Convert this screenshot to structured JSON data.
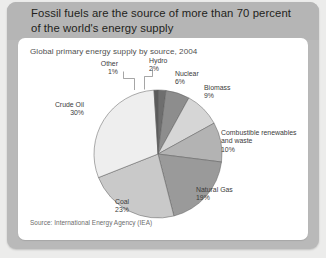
{
  "header": {
    "title": "Fossil fuels are the source of more than 70 percent of the world's energy supply"
  },
  "card": {
    "subtitle": "Global primary energy supply by source, 2004",
    "source": "Source: International Energy Agency (IEA)"
  },
  "chart_data": {
    "type": "pie",
    "title": "Global primary energy supply by source, 2004",
    "subtitle": "",
    "xlabel": "",
    "ylabel": "",
    "units": "percent",
    "total": 100,
    "source": "Source: International Energy Agency (IEA)",
    "legend_position": "none",
    "labels_outside": true,
    "start_angle_deg": 0,
    "direction": "clockwise",
    "categories": [
      "Hydro",
      "Nuclear",
      "Biomass",
      "Combustible renewables and waste",
      "Natural Gas",
      "Coal",
      "Crude Oil",
      "Other"
    ],
    "values": [
      2,
      6,
      9,
      10,
      19,
      23,
      30,
      1
    ],
    "slices": [
      {
        "label": "Hydro",
        "value": 2,
        "value_text": "2%",
        "color": "#6e6e6e"
      },
      {
        "label": "Nuclear",
        "value": 6,
        "value_text": "6%",
        "color": "#8d8d8d"
      },
      {
        "label": "Biomass",
        "value": 9,
        "value_text": "9%",
        "color": "#d6d6d6"
      },
      {
        "label": "Combustible renewables and waste",
        "value": 10,
        "value_text": "10%",
        "color": "#b3b3b3"
      },
      {
        "label": "Natural Gas",
        "value": 19,
        "value_text": "19%",
        "color": "#9a9a9a"
      },
      {
        "label": "Coal",
        "value": 23,
        "value_text": "23%",
        "color": "#c9c9c9"
      },
      {
        "label": "Crude Oil",
        "value": 30,
        "value_text": "30%",
        "color": "#eeeeee"
      },
      {
        "label": "Other",
        "value": 1,
        "value_text": "1%",
        "color": "#5b5b5b"
      }
    ],
    "annotations": [
      {
        "name": "other",
        "label": "Other",
        "value_text": "1%",
        "leader_line": true
      },
      {
        "name": "hydro",
        "label": "Hydro",
        "value_text": "2%",
        "leader_line": true
      }
    ]
  },
  "colors": {
    "panel": "#b9b9b9",
    "card": "#ffffff",
    "text": "#231f20",
    "muted": "#6b6b6b"
  }
}
